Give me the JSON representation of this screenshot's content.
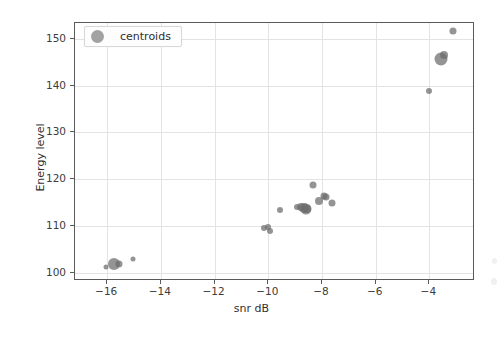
{
  "figure": {
    "background_color": "#ffffff",
    "axes_color": "#5a5a5a",
    "grid_color": "#e3e3e3",
    "marker_color": "#6b6b6b"
  },
  "legend": {
    "label": "centroids",
    "marker_name": "centroid-marker-swatch",
    "position": "upper-left"
  },
  "chart_data": {
    "type": "scatter",
    "title": "",
    "xlabel": "snr dB",
    "ylabel": "Energy level",
    "xlim": [
      -17.2,
      -2.3
    ],
    "ylim": [
      98.2,
      153.4
    ],
    "xticks": [
      -16,
      -14,
      -12,
      -10,
      -8,
      -6,
      -4
    ],
    "yticks": [
      100,
      110,
      120,
      130,
      140,
      150
    ],
    "xticklabels": [
      "−16",
      "−14",
      "−12",
      "−10",
      "−8",
      "−6",
      "−4"
    ],
    "yticklabels": [
      "100",
      "110",
      "120",
      "130",
      "140",
      "150"
    ],
    "grid": true,
    "legend_position": "upper left",
    "series": [
      {
        "name": "centroids",
        "color": "#6b6b6b",
        "points": [
          {
            "x": -16.05,
            "y": 101.2,
            "size": 5
          },
          {
            "x": -15.75,
            "y": 101.8,
            "size": 12
          },
          {
            "x": -15.55,
            "y": 101.9,
            "size": 7
          },
          {
            "x": -15.05,
            "y": 102.9,
            "size": 5
          },
          {
            "x": -10.15,
            "y": 109.5,
            "size": 6
          },
          {
            "x": -10.02,
            "y": 109.7,
            "size": 6
          },
          {
            "x": -9.92,
            "y": 109.0,
            "size": 6
          },
          {
            "x": -9.55,
            "y": 113.4,
            "size": 6
          },
          {
            "x": -8.92,
            "y": 114.1,
            "size": 6
          },
          {
            "x": -8.78,
            "y": 114.1,
            "size": 8
          },
          {
            "x": -8.68,
            "y": 113.8,
            "size": 10
          },
          {
            "x": -8.6,
            "y": 113.6,
            "size": 11
          },
          {
            "x": -8.55,
            "y": 113.5,
            "size": 8
          },
          {
            "x": -8.32,
            "y": 118.8,
            "size": 7
          },
          {
            "x": -8.12,
            "y": 115.3,
            "size": 8
          },
          {
            "x": -7.92,
            "y": 116.4,
            "size": 7
          },
          {
            "x": -7.85,
            "y": 116.2,
            "size": 7
          },
          {
            "x": -7.62,
            "y": 114.9,
            "size": 7
          },
          {
            "x": -4.02,
            "y": 138.9,
            "size": 6
          },
          {
            "x": -3.55,
            "y": 145.6,
            "size": 13
          },
          {
            "x": -3.45,
            "y": 146.5,
            "size": 8
          },
          {
            "x": -3.12,
            "y": 151.7,
            "size": 7
          }
        ]
      }
    ]
  }
}
